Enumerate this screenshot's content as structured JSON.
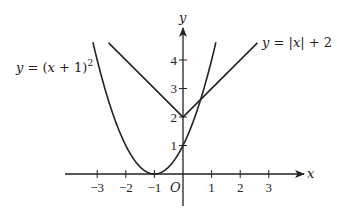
{
  "chart_data": {
    "type": "line",
    "title": "",
    "xlabel": "x",
    "ylabel": "y",
    "origin_label": "O",
    "xlim": [
      -3.5,
      4.2
    ],
    "ylim": [
      -0.9,
      5.0
    ],
    "x_ticks": [
      "-3",
      "-2",
      "-1",
      "1",
      "2",
      "3"
    ],
    "x_tick_values": [
      -3,
      -2,
      -1,
      1,
      2,
      3
    ],
    "y_ticks": [
      "1",
      "2",
      "3",
      "4"
    ],
    "y_tick_values": [
      1,
      2,
      3,
      4
    ],
    "grid": false,
    "series": [
      {
        "name": "y = (x + 1)^2",
        "label": "y = (x + 1)²",
        "equation": "(x+1)^2",
        "x_range": [
          -3.15,
          1.15
        ],
        "key_points": [
          [
            -3,
            4
          ],
          [
            -2,
            1
          ],
          [
            -1,
            0
          ],
          [
            0,
            1
          ],
          [
            1,
            4
          ]
        ]
      },
      {
        "name": "y = |x| + 2",
        "label": "y = |x| + 2",
        "equation": "abs(x)+2",
        "x_range": [
          -2.6,
          2.6
        ],
        "key_points": [
          [
            -2.6,
            4.6
          ],
          [
            0,
            2
          ],
          [
            2.6,
            4.6
          ]
        ]
      }
    ],
    "annotations": [
      "y = (x + 1)²",
      "y = |x| + 2"
    ]
  },
  "labels": {
    "parabola": "y = (x + 1)",
    "parabola_exp": "2",
    "abs": "y = |x| + 2",
    "x_axis": "x",
    "y_axis": "y",
    "origin": "O"
  }
}
